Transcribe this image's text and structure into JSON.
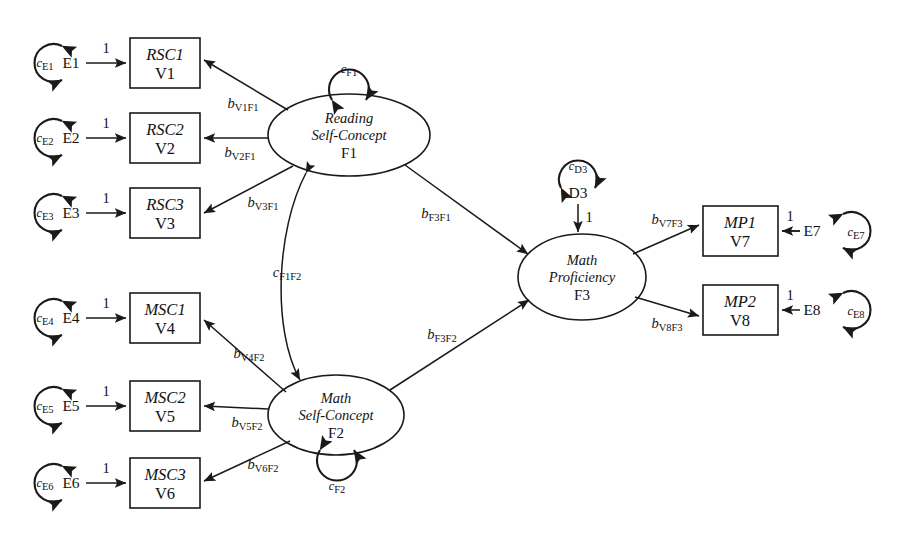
{
  "diagram": {
    "type": "sem-path-diagram",
    "background_color": "#ffffff",
    "stroke_color": "#1a1a1a"
  },
  "observed_variables": [
    {
      "id": "v1",
      "name": "RSC1",
      "code": "V1",
      "x": 165,
      "y": 63
    },
    {
      "id": "v2",
      "name": "RSC2",
      "code": "V2",
      "x": 165,
      "y": 138
    },
    {
      "id": "v3",
      "name": "RSC3",
      "code": "V3",
      "x": 165,
      "y": 213
    },
    {
      "id": "v4",
      "name": "MSC1",
      "code": "V4",
      "x": 165,
      "y": 318
    },
    {
      "id": "v5",
      "name": "MSC2",
      "code": "V5",
      "x": 165,
      "y": 406
    },
    {
      "id": "v6",
      "name": "MSC3",
      "code": "V6",
      "x": 165,
      "y": 483
    },
    {
      "id": "v7",
      "name": "MP1",
      "code": "V7",
      "x": 740,
      "y": 231
    },
    {
      "id": "v8",
      "name": "MP2",
      "code": "V8",
      "x": 740,
      "y": 310
    }
  ],
  "latent_factors": [
    {
      "id": "f1",
      "line1": "Reading",
      "line2": "Self-Concept",
      "code": "F1",
      "cx": 349,
      "cy": 135,
      "rx": 81,
      "ry": 41
    },
    {
      "id": "f2",
      "line1": "Math",
      "line2": "Self-Concept",
      "code": "F2",
      "cx": 336,
      "cy": 415,
      "rx": 68,
      "ry": 40
    },
    {
      "id": "f3",
      "line1": "Math",
      "line2": "Proficiency",
      "code": "F3",
      "cx": 582,
      "cy": 277,
      "rx": 64,
      "ry": 43
    }
  ],
  "residuals": [
    {
      "id": "e1",
      "label": "E1",
      "x": 71,
      "y": 63,
      "variance": "c",
      "variance_sub": "E1",
      "side": "left"
    },
    {
      "id": "e2",
      "label": "E2",
      "x": 71,
      "y": 138,
      "variance": "c",
      "variance_sub": "E2",
      "side": "left"
    },
    {
      "id": "e3",
      "label": "E3",
      "x": 71,
      "y": 213,
      "variance": "c",
      "variance_sub": "E3",
      "side": "left"
    },
    {
      "id": "e4",
      "label": "E4",
      "x": 71,
      "y": 318,
      "variance": "c",
      "variance_sub": "E4",
      "side": "left"
    },
    {
      "id": "e5",
      "label": "E5",
      "x": 71,
      "y": 406,
      "variance": "c",
      "variance_sub": "E5",
      "side": "left"
    },
    {
      "id": "e6",
      "label": "E6",
      "x": 71,
      "y": 483,
      "variance": "c",
      "variance_sub": "E6",
      "side": "left"
    },
    {
      "id": "e7",
      "label": "E7",
      "x": 823,
      "y": 231,
      "variance": "c",
      "variance_sub": "E7",
      "side": "right"
    },
    {
      "id": "e8",
      "label": "E8",
      "x": 823,
      "y": 310,
      "variance": "c",
      "variance_sub": "E8",
      "side": "right"
    }
  ],
  "disturbance": {
    "id": "d3",
    "label": "D3",
    "x": 578,
    "y": 193,
    "variance": "c",
    "variance_sub": "D3",
    "fixed_path_label": "1"
  },
  "factor_variances": [
    {
      "id": "cf1",
      "symbol": "c",
      "sub": "F1",
      "x": 349,
      "y": 66,
      "attached_to": "f1",
      "position": "above"
    },
    {
      "id": "cf2",
      "symbol": "c",
      "sub": "F2",
      "x": 336,
      "y": 487,
      "attached_to": "f2",
      "position": "below"
    }
  ],
  "factor_covariance": {
    "id": "cf1f2",
    "symbol": "c",
    "sub": "F1F2",
    "x": 288,
    "y": 272,
    "between": [
      "f1",
      "f2"
    ]
  },
  "fixed_loadings_label": "1",
  "loading_paths": [
    {
      "id": "b_v1f1",
      "symbol": "b",
      "sub": "V1F1",
      "from": "f1",
      "to": "v1",
      "x": 242,
      "y": 105
    },
    {
      "id": "b_v2f1",
      "symbol": "b",
      "sub": "V2F1",
      "from": "f1",
      "to": "v2",
      "x": 243,
      "y": 154
    },
    {
      "id": "b_v3f1",
      "symbol": "b",
      "sub": "V3F1",
      "from": "f1",
      "to": "v3",
      "x": 263,
      "y": 204
    },
    {
      "id": "b_v4f2",
      "symbol": "b",
      "sub": "V4F2",
      "from": "f2",
      "to": "v4",
      "x": 247,
      "y": 355
    },
    {
      "id": "b_v5f2",
      "symbol": "b",
      "sub": "V5F2",
      "from": "f2",
      "to": "v5",
      "x": 248,
      "y": 424
    },
    {
      "id": "b_v6f2",
      "symbol": "b",
      "sub": "V6F2",
      "from": "f2",
      "to": "v6",
      "x": 262,
      "y": 466
    },
    {
      "id": "b_v7f3",
      "symbol": "b",
      "sub": "V7F3",
      "from": "f3",
      "to": "v7",
      "x": 667,
      "y": 221
    },
    {
      "id": "b_v8f3",
      "symbol": "b",
      "sub": "V8F3",
      "from": "f3",
      "to": "v8",
      "x": 667,
      "y": 325
    }
  ],
  "structural_paths": [
    {
      "id": "b_f3f1",
      "symbol": "b",
      "sub": "F3F1",
      "from": "f1",
      "to": "f3",
      "x": 437,
      "y": 215
    },
    {
      "id": "b_f3f2",
      "symbol": "b",
      "sub": "F3F2",
      "from": "f2",
      "to": "f3",
      "x": 442,
      "y": 336
    }
  ]
}
